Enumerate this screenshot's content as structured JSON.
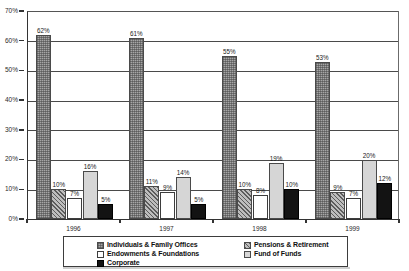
{
  "chart_data": {
    "type": "bar",
    "title": "",
    "xlabel": "",
    "ylabel": "",
    "ylim": [
      0,
      70
    ],
    "ytick_labels": [
      "0%",
      "10%",
      "20%",
      "30%",
      "40%",
      "50%",
      "60%",
      "70%"
    ],
    "ytick_values": [
      0,
      10,
      20,
      30,
      40,
      50,
      60,
      70
    ],
    "grid": true,
    "legend_position": "bottom",
    "categories": [
      "1996",
      "1997",
      "1998",
      "1999"
    ],
    "series": [
      {
        "name": "Individuals & Family Offices",
        "values": [
          62,
          61,
          55,
          53
        ],
        "labels": [
          "62%",
          "61%",
          "55%",
          "53%"
        ],
        "pattern": "dotted-gray"
      },
      {
        "name": "Pensions & Retirement",
        "values": [
          10,
          11,
          10,
          9
        ],
        "labels": [
          "10%",
          "11%",
          "10%",
          "9%"
        ],
        "pattern": "diagonal-hatch"
      },
      {
        "name": "Endowments & Foundations",
        "values": [
          7,
          9,
          8,
          7
        ],
        "labels": [
          "7%",
          "9%",
          "8%",
          "7%"
        ],
        "pattern": "white"
      },
      {
        "name": "Fund of Funds",
        "values": [
          16,
          14,
          19,
          20
        ],
        "labels": [
          "16%",
          "14%",
          "19%",
          "20%"
        ],
        "pattern": "light-gray"
      },
      {
        "name": "Corporate",
        "values": [
          5,
          5,
          10,
          12
        ],
        "labels": [
          "5%",
          "5%",
          "10%",
          "12%"
        ],
        "pattern": "black"
      }
    ]
  },
  "legend": {
    "items": [
      {
        "label": "Individuals & Family Offices",
        "swatch": "dotted-gray"
      },
      {
        "label": "Endowments & Foundations",
        "swatch": "white"
      },
      {
        "label": "Corporate",
        "swatch": "black"
      },
      {
        "label": "Pensions & Retirement",
        "swatch": "diagonal-hatch"
      },
      {
        "label": "Fund of Funds",
        "swatch": "light-gray"
      }
    ]
  }
}
